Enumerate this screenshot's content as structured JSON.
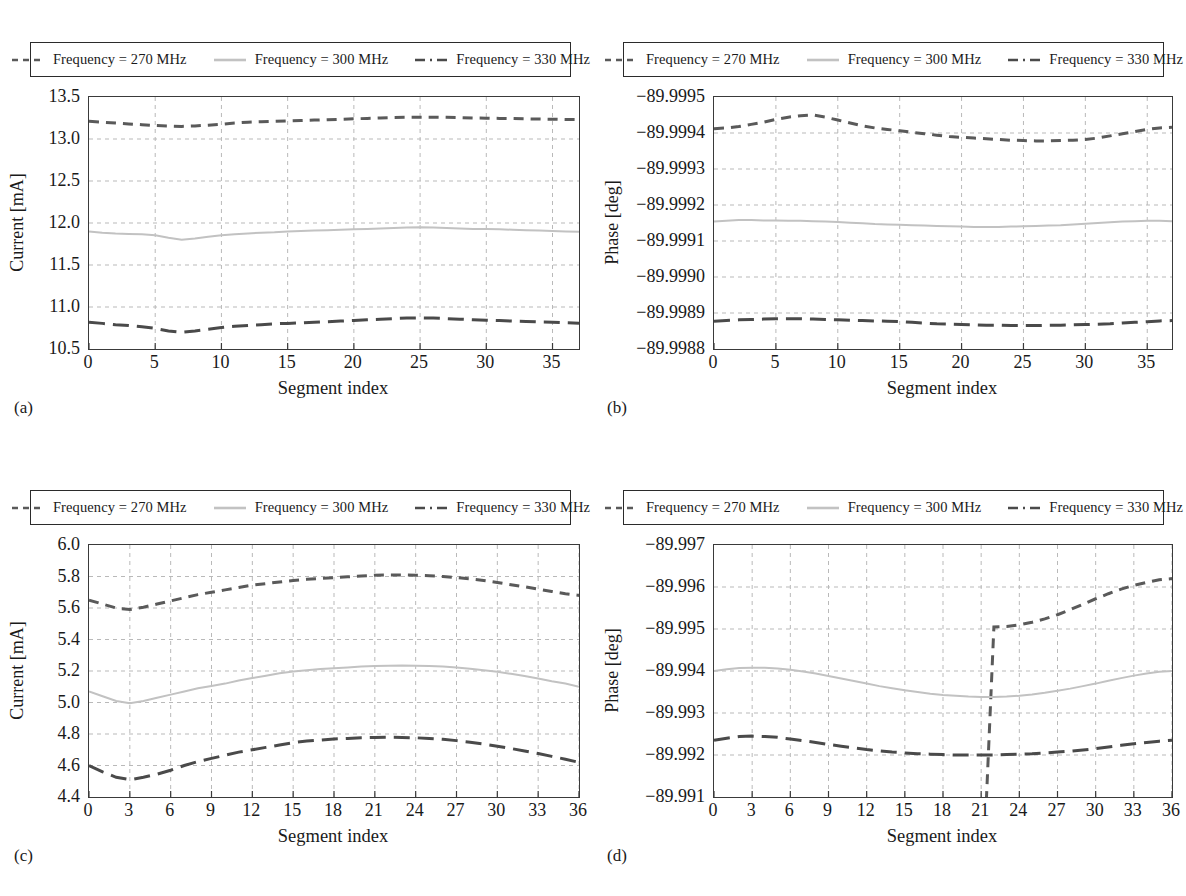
{
  "legend": {
    "entries": [
      {
        "label": "Frequency = 270 MHz",
        "style": "dashed",
        "color": "#5a5a5a"
      },
      {
        "label": "Frequency = 300 MHz",
        "style": "solid",
        "color": "#c2c2c2"
      },
      {
        "label": "Frequency = 330 MHz",
        "style": "dashdot",
        "color": "#4a4a4a"
      }
    ]
  },
  "panels": [
    {
      "key": "a",
      "label": "(a)"
    },
    {
      "key": "b",
      "label": "(b)"
    },
    {
      "key": "c",
      "label": "(c)"
    },
    {
      "key": "d",
      "label": "(d)"
    }
  ],
  "chart_data": [
    {
      "type": "line",
      "panel": "(a)",
      "title": "",
      "xlabel": "Segment index",
      "ylabel": "Current [mA]",
      "xlim": [
        0,
        37
      ],
      "ylim": [
        10.5,
        13.5
      ],
      "xticks": [
        0,
        5,
        10,
        15,
        20,
        25,
        30,
        35
      ],
      "yticks": [
        "10.5",
        "11.0",
        "11.5",
        "12.0",
        "12.5",
        "13.0",
        "13.5"
      ],
      "grid": true,
      "legend_position": "above",
      "x": [
        0,
        1,
        2,
        3,
        4,
        5,
        6,
        7,
        8,
        9,
        10,
        11,
        12,
        13,
        14,
        15,
        16,
        17,
        18,
        19,
        20,
        21,
        22,
        23,
        24,
        25,
        26,
        27,
        28,
        29,
        30,
        31,
        32,
        33,
        34,
        35,
        36,
        37
      ],
      "series": [
        {
          "name": "Frequency = 270 MHz",
          "style": "dashed",
          "color": "#5a5a5a",
          "values": [
            13.21,
            13.2,
            13.19,
            13.18,
            13.17,
            13.16,
            13.155,
            13.15,
            13.155,
            13.165,
            13.175,
            13.19,
            13.2,
            13.205,
            13.21,
            13.215,
            13.22,
            13.225,
            13.23,
            13.235,
            13.24,
            13.245,
            13.25,
            13.255,
            13.258,
            13.26,
            13.26,
            13.258,
            13.255,
            13.25,
            13.248,
            13.245,
            13.243,
            13.24,
            13.238,
            13.235,
            13.232,
            13.23
          ]
        },
        {
          "name": "Frequency = 300 MHz",
          "style": "solid",
          "color": "#c2c2c2",
          "values": [
            11.9,
            11.885,
            11.875,
            11.87,
            11.865,
            11.855,
            11.825,
            11.8,
            11.815,
            11.835,
            11.855,
            11.865,
            11.875,
            11.885,
            11.89,
            11.9,
            11.905,
            11.91,
            11.915,
            11.92,
            11.925,
            11.93,
            11.935,
            11.94,
            11.945,
            11.948,
            11.945,
            11.94,
            11.935,
            11.93,
            11.928,
            11.925,
            11.92,
            11.915,
            11.91,
            11.905,
            11.9,
            11.895
          ]
        },
        {
          "name": "Frequency = 330 MHz",
          "style": "dashdot",
          "color": "#4a4a4a",
          "values": [
            10.82,
            10.805,
            10.79,
            10.78,
            10.765,
            10.745,
            10.715,
            10.7,
            10.715,
            10.735,
            10.755,
            10.77,
            10.78,
            10.79,
            10.8,
            10.805,
            10.81,
            10.818,
            10.825,
            10.832,
            10.84,
            10.848,
            10.855,
            10.862,
            10.868,
            10.87,
            10.868,
            10.862,
            10.855,
            10.848,
            10.842,
            10.838,
            10.832,
            10.828,
            10.822,
            10.818,
            10.812,
            10.808
          ]
        }
      ]
    },
    {
      "type": "line",
      "panel": "(b)",
      "title": "",
      "xlabel": "Segment index",
      "ylabel": "Phase [deg]",
      "xlim": [
        0,
        37
      ],
      "ylim": [
        -89.9995,
        -89.9988
      ],
      "xticks": [
        0,
        5,
        10,
        15,
        20,
        25,
        30,
        35
      ],
      "yticks": [
        "−89.9988",
        "−89.9989",
        "−89.9990",
        "−89.9991",
        "−89.9992",
        "−89.9993",
        "−89.9994",
        "−89.9995"
      ],
      "grid": true,
      "legend_position": "above",
      "x": [
        0,
        1,
        2,
        3,
        4,
        5,
        6,
        7,
        8,
        9,
        10,
        11,
        12,
        13,
        14,
        15,
        16,
        17,
        18,
        19,
        20,
        21,
        22,
        23,
        24,
        25,
        26,
        27,
        28,
        29,
        30,
        31,
        32,
        33,
        34,
        35,
        36,
        37
      ],
      "series": [
        {
          "name": "Frequency = 270 MHz",
          "style": "dashed",
          "color": "#5a5a5a",
          "values": [
            -89.998888,
            -89.998886,
            -89.998882,
            -89.998876,
            -89.99887,
            -89.998862,
            -89.998856,
            -89.998852,
            -89.99885,
            -89.998856,
            -89.998864,
            -89.998872,
            -89.99888,
            -89.998886,
            -89.99889,
            -89.998894,
            -89.998898,
            -89.998902,
            -89.998906,
            -89.99891,
            -89.998912,
            -89.998914,
            -89.998916,
            -89.998918,
            -89.99892,
            -89.998921,
            -89.998922,
            -89.998922,
            -89.998921,
            -89.99892,
            -89.998918,
            -89.998914,
            -89.998908,
            -89.998902,
            -89.998896,
            -89.99889,
            -89.998886,
            -89.998884
          ]
        },
        {
          "name": "Frequency = 300 MHz",
          "style": "solid",
          "color": "#c2c2c2",
          "values": [
            -89.999146,
            -89.999144,
            -89.999142,
            -89.999142,
            -89.999143,
            -89.999143,
            -89.999144,
            -89.999144,
            -89.999145,
            -89.999146,
            -89.999147,
            -89.999149,
            -89.999151,
            -89.999153,
            -89.999154,
            -89.999155,
            -89.999156,
            -89.999157,
            -89.999158,
            -89.999159,
            -89.99916,
            -89.999161,
            -89.999161,
            -89.999161,
            -89.99916,
            -89.999159,
            -89.999158,
            -89.999157,
            -89.999156,
            -89.999154,
            -89.999152,
            -89.99915,
            -89.999148,
            -89.999146,
            -89.999145,
            -89.999144,
            -89.999144,
            -89.999145
          ]
        },
        {
          "name": "Frequency = 330 MHz",
          "style": "dashdot",
          "color": "#4a4a4a",
          "values": [
            -89.999423,
            -89.999421,
            -89.999419,
            -89.999418,
            -89.999417,
            -89.999416,
            -89.999416,
            -89.999416,
            -89.999417,
            -89.999418,
            -89.999419,
            -89.99942,
            -89.999421,
            -89.999422,
            -89.999423,
            -89.999424,
            -89.999426,
            -89.999428,
            -89.99943,
            -89.999431,
            -89.999432,
            -89.999433,
            -89.999434,
            -89.999434,
            -89.999435,
            -89.999435,
            -89.999435,
            -89.999434,
            -89.999434,
            -89.999433,
            -89.999432,
            -89.999431,
            -89.99943,
            -89.999428,
            -89.999426,
            -89.999424,
            -89.999422,
            -89.999421
          ]
        }
      ]
    },
    {
      "type": "line",
      "panel": "(c)",
      "title": "",
      "xlabel": "Segment index",
      "ylabel": "Current [mA]",
      "xlim": [
        0,
        36
      ],
      "ylim": [
        4.4,
        6.0
      ],
      "xticks": [
        0,
        3,
        6,
        9,
        12,
        15,
        18,
        21,
        24,
        27,
        30,
        33,
        36
      ],
      "yticks": [
        "4.4",
        "4.6",
        "4.8",
        "5.0",
        "5.2",
        "5.4",
        "5.6",
        "5.8",
        "6.0"
      ],
      "grid": true,
      "legend_position": "above",
      "x": [
        0,
        1,
        2,
        3,
        4,
        5,
        6,
        7,
        8,
        9,
        10,
        11,
        12,
        13,
        14,
        15,
        16,
        17,
        18,
        19,
        20,
        21,
        22,
        23,
        24,
        25,
        26,
        27,
        28,
        29,
        30,
        31,
        32,
        33,
        34,
        35,
        36
      ],
      "series": [
        {
          "name": "Frequency = 270 MHz",
          "style": "dashed",
          "color": "#5a5a5a",
          "values": [
            5.65,
            5.625,
            5.6,
            5.59,
            5.605,
            5.625,
            5.645,
            5.665,
            5.685,
            5.7,
            5.715,
            5.73,
            5.745,
            5.755,
            5.765,
            5.775,
            5.782,
            5.788,
            5.793,
            5.798,
            5.803,
            5.808,
            5.81,
            5.81,
            5.808,
            5.805,
            5.8,
            5.793,
            5.785,
            5.775,
            5.762,
            5.748,
            5.735,
            5.72,
            5.705,
            5.69,
            5.68
          ]
        },
        {
          "name": "Frequency = 300 MHz",
          "style": "solid",
          "color": "#c2c2c2",
          "values": [
            5.07,
            5.04,
            5.01,
            4.995,
            5.01,
            5.03,
            5.05,
            5.07,
            5.09,
            5.105,
            5.12,
            5.14,
            5.155,
            5.17,
            5.185,
            5.197,
            5.205,
            5.212,
            5.218,
            5.223,
            5.228,
            5.232,
            5.234,
            5.235,
            5.234,
            5.232,
            5.228,
            5.222,
            5.215,
            5.205,
            5.195,
            5.182,
            5.168,
            5.152,
            5.135,
            5.12,
            5.1
          ]
        },
        {
          "name": "Frequency = 330 MHz",
          "style": "dashdot",
          "color": "#4a4a4a",
          "values": [
            4.6,
            4.56,
            4.525,
            4.51,
            4.525,
            4.545,
            4.57,
            4.6,
            4.625,
            4.645,
            4.665,
            4.685,
            4.7,
            4.715,
            4.73,
            4.745,
            4.755,
            4.762,
            4.768,
            4.772,
            4.776,
            4.778,
            4.779,
            4.778,
            4.776,
            4.772,
            4.766,
            4.758,
            4.748,
            4.736,
            4.722,
            4.708,
            4.692,
            4.676,
            4.658,
            4.64,
            4.62
          ]
        }
      ]
    },
    {
      "type": "line",
      "panel": "(d)",
      "title": "",
      "xlabel": "Segment index",
      "ylabel": "Phase [deg]",
      "xlim": [
        0,
        36
      ],
      "ylim": [
        -89.997,
        -89.991
      ],
      "xticks": [
        0,
        3,
        6,
        9,
        12,
        15,
        18,
        21,
        24,
        27,
        30,
        33,
        36
      ],
      "yticks": [
        "−89.991",
        "−89.992",
        "−89.993",
        "−89.994",
        "−89.995",
        "−89.996",
        "−89.997"
      ],
      "grid": true,
      "legend_position": "above",
      "x": [
        0,
        1,
        2,
        3,
        4,
        5,
        6,
        7,
        8,
        9,
        10,
        11,
        12,
        13,
        14,
        15,
        16,
        17,
        18,
        19,
        20,
        21,
        22,
        23,
        24,
        25,
        26,
        27,
        28,
        29,
        30,
        31,
        32,
        33,
        34,
        35,
        36
      ],
      "series": [
        {
          "name": "Frequency = 270 MHz",
          "style": "dashed",
          "color": "#5a5a5a",
          "values": [
            -89.9982,
            -89.99805,
            -89.99793,
            -89.99786,
            -89.99785,
            -89.9979,
            -89.998,
            -89.99814,
            -89.9983,
            -89.99848,
            -89.99866,
            -89.99884,
            -89.99901,
            -89.99917,
            -89.99932,
            -89.99945,
            -89.99957,
            -89.99967,
            -89.99976,
            -89.99983,
            -89.99989,
            -89.99993,
            -89.99295,
            -89.99294,
            -89.9929,
            -89.99284,
            -89.99276,
            -89.99266,
            -89.99254,
            -89.99241,
            -89.99228,
            -89.99216,
            -89.99205,
            -89.99196,
            -89.99189,
            -89.99183,
            -89.9918
          ]
        },
        {
          "name": "Frequency = 300 MHz",
          "style": "solid",
          "color": "#c2c2c2",
          "values": [
            -89.994,
            -89.99396,
            -89.99393,
            -89.99392,
            -89.99392,
            -89.99394,
            -89.99397,
            -89.99401,
            -89.99406,
            -89.99412,
            -89.99418,
            -89.99424,
            -89.9943,
            -89.99436,
            -89.99441,
            -89.99446,
            -89.9945,
            -89.99454,
            -89.99457,
            -89.99459,
            -89.99461,
            -89.99462,
            -89.99462,
            -89.99461,
            -89.99459,
            -89.99456,
            -89.99452,
            -89.99447,
            -89.99442,
            -89.99436,
            -89.9943,
            -89.99423,
            -89.99417,
            -89.99411,
            -89.99406,
            -89.99402,
            -89.994
          ]
        },
        {
          "name": "Frequency = 330 MHz",
          "style": "dashdot",
          "color": "#4a4a4a",
          "values": [
            -89.99565,
            -89.9956,
            -89.99556,
            -89.99555,
            -89.99556,
            -89.99558,
            -89.99562,
            -89.99566,
            -89.9957,
            -89.99575,
            -89.99579,
            -89.99583,
            -89.99587,
            -89.9959,
            -89.99593,
            -89.99595,
            -89.99597,
            -89.99598,
            -89.99599,
            -89.996,
            -89.996,
            -89.996,
            -89.996,
            -89.99599,
            -89.99598,
            -89.99597,
            -89.99595,
            -89.99593,
            -89.99591,
            -89.99588,
            -89.99585,
            -89.99581,
            -89.99577,
            -89.99573,
            -89.9957,
            -89.99567,
            -89.99565
          ]
        }
      ]
    }
  ]
}
